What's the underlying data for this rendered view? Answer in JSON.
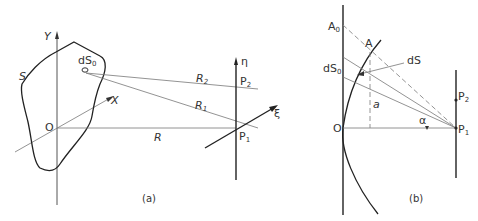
{
  "figure_a": {
    "caption": "(a)",
    "labels": {
      "y_axis": "Y",
      "x_axis": "X",
      "origin": "O",
      "surface": "S",
      "element": "dS",
      "element_sub": "0",
      "r1": "R",
      "r1_sub": "1",
      "r2": "R",
      "r2_sub": "2",
      "r": "R",
      "eta": "η",
      "xi": "ξ",
      "p1": "P",
      "p1_sub": "1",
      "p2": "P",
      "p2_sub": "2"
    }
  },
  "figure_b": {
    "caption": "(b)",
    "labels": {
      "a0": "A",
      "a0_sub": "0",
      "a": "A",
      "ds0": "dS",
      "ds0_sub": "0",
      "ds": "dS",
      "a_len": "a",
      "origin": "O",
      "alpha": "α",
      "p1": "P",
      "p1_sub": "1",
      "p2": "P",
      "p2_sub": "2"
    }
  },
  "colors": {
    "line": "#222222",
    "thin": "#777777",
    "background": "#ffffff"
  }
}
